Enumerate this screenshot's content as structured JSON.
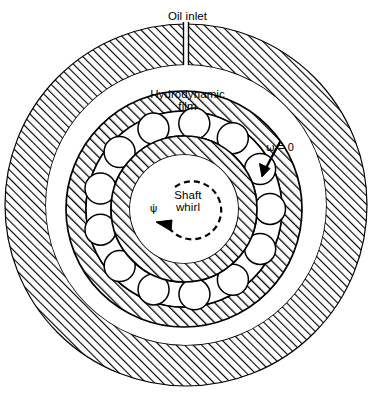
{
  "figure": {
    "type": "engineering-cross-section",
    "background_color": "#ffffff",
    "line_color": "#000000"
  },
  "labels": {
    "oil_inlet": "Oil inlet",
    "hydrodynamic_film_line1": "Hydrodynamic",
    "hydrodynamic_film_line2": "film",
    "omega_symbol": "ω",
    "omega_equation": " = 0",
    "shaft_whirl_line1": "Shaft",
    "shaft_whirl_line2": "whirl",
    "whirl_rate_symbol": "ψ̇"
  },
  "geometry": {
    "center_x": 186,
    "center_y": 205,
    "housing_outer_radius": 181,
    "housing_inner_radius": 140,
    "film_outer_radius": 140,
    "race_outer_radius": 118,
    "race_outer_inner_radius": 98,
    "ball_pitch_radius": 86,
    "ball_radius": 15.5,
    "race_inner_outer_radius": 73,
    "shaft_radius": 54,
    "bearing_offset_x": -2,
    "bearing_offset_y": 4,
    "ball_count": 13,
    "oil_inlet_slot_width": 5,
    "hatch_angle_deg": 45
  },
  "annotations": {
    "omega_arrow": {
      "description": "tapered arrow pointing down-left indicating zero outer-race rotation",
      "tip_x": 262,
      "tip_y": 175,
      "tail_x": 279,
      "tail_y": 141
    },
    "whirl_arrow": {
      "description": "dashed circular arc with arrowhead indicating shaft whirl direction",
      "arc_radius": 29,
      "dash_pattern": "6 4"
    }
  },
  "icons": {
    "oil-inlet-slot": "vertical-channel",
    "omega-arrow": "curved-arrow",
    "whirl-arc": "dashed-circular-arrow"
  }
}
